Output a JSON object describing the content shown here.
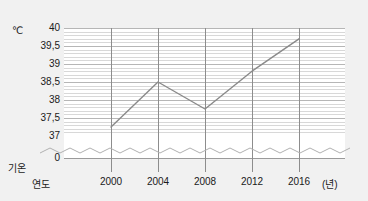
{
  "chart_data": {
    "type": "line",
    "title": "",
    "xlabel": "연도",
    "ylabel": "기온",
    "x_unit": "(년)",
    "y_unit": "℃",
    "categories": [
      "2000",
      "2004",
      "2008",
      "2012",
      "2016"
    ],
    "values": [
      37.25,
      38.5,
      37.75,
      38.8,
      39.7
    ],
    "series": [
      {
        "name": "기온",
        "values": [
          37.25,
          38.5,
          37.75,
          38.8,
          39.7
        ]
      }
    ],
    "ylim": [
      37,
      40
    ],
    "y_ticks": [
      "40",
      "39,5",
      "39",
      "38,5",
      "38",
      "37,5",
      "37",
      "0"
    ],
    "y_tick_values": [
      40,
      39.5,
      39,
      38.5,
      38,
      37.5,
      37,
      0
    ],
    "x_ticks": [
      "2000",
      "2004",
      "2008",
      "2012",
      "2016"
    ],
    "grid": true,
    "minor_grid": true,
    "axis_break": true,
    "legend": "none",
    "line_color": "#8a8a8a",
    "grid_color": "#d8d8d8",
    "major_grid_color": "#b6b6b6",
    "background": "#f1f1f1",
    "plot_background": "#ffffff"
  }
}
